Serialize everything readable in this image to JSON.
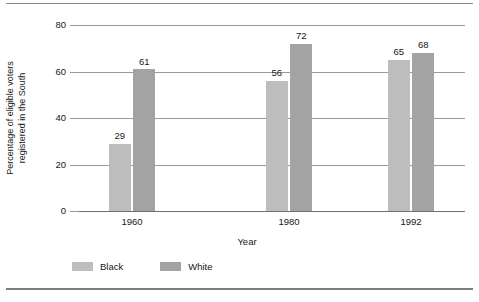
{
  "chart_data": {
    "type": "bar",
    "title": "",
    "subtitle": "",
    "categories": [
      "1960",
      "1980",
      "1992"
    ],
    "series": [
      {
        "name": "Black",
        "values": [
          29,
          56,
          65
        ],
        "color": "#bdbdbd"
      },
      {
        "name": "White",
        "values": [
          61,
          72,
          68
        ],
        "color": "#a3a3a3"
      }
    ],
    "xlabel": "Year",
    "ylabel": "Percentage of eligible voters registered in the South",
    "ylabel_lines": [
      "Percentage of eligible voters",
      "registered in the South"
    ],
    "ylim": [
      0,
      80
    ],
    "yticks": [
      0,
      20,
      40,
      60,
      80
    ],
    "ytick_labels": [
      "0",
      "20",
      "40",
      "60",
      "80"
    ],
    "grid": true,
    "grid_axis": "y",
    "legend_position": "bottom-left",
    "data_labels": true,
    "background_color": "#ffffff",
    "frame_color": "#8c8c8c"
  }
}
